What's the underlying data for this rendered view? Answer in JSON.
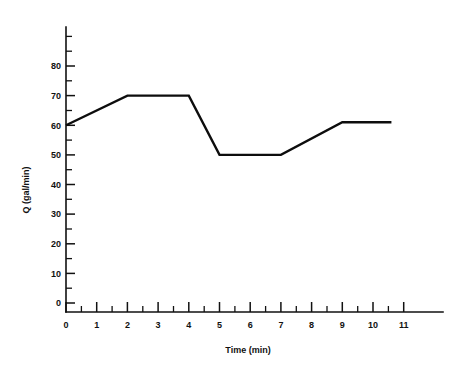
{
  "chart_data": {
    "type": "line",
    "title": "",
    "xlabel": "Time (min)",
    "ylabel": "Q (gal/min)",
    "xlim": [
      0,
      12.3
    ],
    "ylim": [
      0,
      92
    ],
    "grid": false,
    "legend": null,
    "x_ticks": [
      0,
      1,
      2,
      3,
      4,
      5,
      6,
      7,
      8,
      9,
      10,
      11
    ],
    "x_tick_labels": [
      "0",
      "1",
      "2",
      "3",
      "4",
      "5",
      "6",
      "7",
      "8",
      "9",
      "10",
      "11"
    ],
    "x_minor_ticks": [
      0.5,
      1.5,
      2.5,
      3.5,
      4.5,
      5.5,
      6.5,
      7.5,
      8.5,
      9.5,
      10.5,
      11.5
    ],
    "y_ticks": [
      0,
      10,
      20,
      30,
      40,
      50,
      60,
      70,
      80
    ],
    "y_tick_labels": [
      "0",
      "10",
      "20",
      "30",
      "40",
      "50",
      "60",
      "70",
      "80"
    ],
    "y_minor_ticks": [
      5,
      15,
      25,
      35,
      45,
      55,
      65,
      75,
      85,
      90
    ],
    "series": [
      {
        "name": "Q",
        "x": [
          0,
          2,
          4,
          5,
          7,
          9,
          10.6
        ],
        "values": [
          60,
          70,
          70,
          50,
          50,
          61,
          61
        ],
        "color": "#0d0d0d"
      }
    ]
  },
  "axes": {
    "y_axis_name": "y-axis",
    "x_axis_name": "x-axis"
  }
}
